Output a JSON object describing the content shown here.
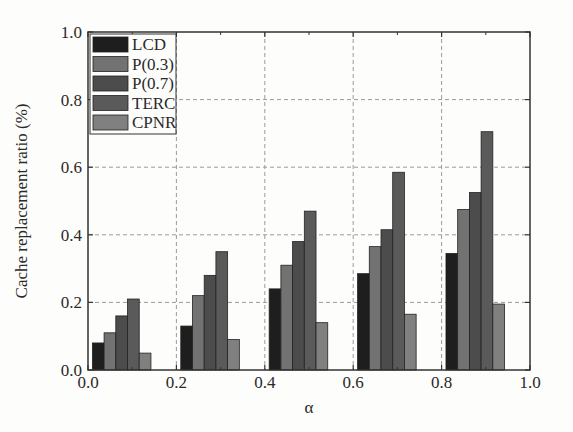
{
  "chart_data": {
    "type": "bar",
    "title": "",
    "xlabel": "α",
    "ylabel": "Cache replacement ratio (%)",
    "xlim": [
      0.0,
      1.0
    ],
    "ylim": [
      0.0,
      1.0
    ],
    "xticks": [
      "0.0",
      "0.2",
      "0.4",
      "0.6",
      "0.8",
      "1.0"
    ],
    "yticks": [
      "0.0",
      "0.2",
      "0.4",
      "0.6",
      "0.8",
      "1.0"
    ],
    "grid": "dashed",
    "legend_position": "upper-left",
    "categories": [
      "0.1",
      "0.3",
      "0.5",
      "0.7",
      "0.9"
    ],
    "series": [
      {
        "name": "LCD",
        "color": "#1e1e1e",
        "values": [
          0.08,
          0.13,
          0.24,
          0.285,
          0.345
        ]
      },
      {
        "name": "P(0.3)",
        "color": "#727272",
        "values": [
          0.11,
          0.22,
          0.31,
          0.365,
          0.475
        ]
      },
      {
        "name": "P(0.7)",
        "color": "#4c4c4c",
        "values": [
          0.16,
          0.28,
          0.38,
          0.415,
          0.525
        ]
      },
      {
        "name": "TERC",
        "color": "#5a5a5a",
        "values": [
          0.21,
          0.35,
          0.47,
          0.585,
          0.705
        ]
      },
      {
        "name": "CPNR",
        "color": "#808080",
        "values": [
          0.05,
          0.09,
          0.14,
          0.165,
          0.195
        ]
      }
    ]
  }
}
